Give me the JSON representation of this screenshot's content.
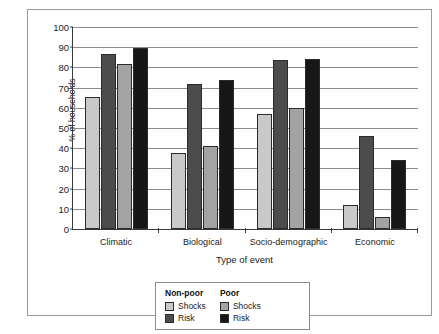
{
  "chart_data": {
    "type": "bar",
    "title": "",
    "xlabel": "Type of event",
    "ylabel": "% of households",
    "ylim": [
      0,
      100
    ],
    "ytick_step": 10,
    "ytick_labels": [
      "100",
      "90",
      "80",
      "70",
      "60",
      "50",
      "40",
      "30",
      "20",
      "10",
      "0"
    ],
    "grid": true,
    "legend_position": "below-center",
    "categories": [
      "Climatic",
      "Biological",
      "Socio-demographic",
      "Economic"
    ],
    "series": [
      {
        "name": "Non-poor Shocks",
        "color": "#c9c9c9",
        "values": [
          65.5,
          37.5,
          57,
          12
        ]
      },
      {
        "name": "Non-poor Risk",
        "color": "#4c4c4c",
        "values": [
          86.5,
          72,
          83.5,
          46
        ]
      },
      {
        "name": "Poor Shocks",
        "color": "#a3a3a3",
        "values": [
          81.5,
          41,
          60,
          6
        ]
      },
      {
        "name": "Poor Risk",
        "color": "#171717",
        "values": [
          89.5,
          74,
          84,
          34
        ]
      }
    ]
  },
  "legend": {
    "columns": [
      {
        "title": "Non-poor",
        "entries": [
          {
            "label": "Shocks",
            "color": "#c9c9c9"
          },
          {
            "label": "Risk",
            "color": "#4c4c4c"
          }
        ]
      },
      {
        "title": "Poor",
        "entries": [
          {
            "label": "Shocks",
            "color": "#a3a3a3"
          },
          {
            "label": "Risk",
            "color": "#171717"
          }
        ]
      }
    ]
  },
  "caption": {
    "text": ""
  }
}
